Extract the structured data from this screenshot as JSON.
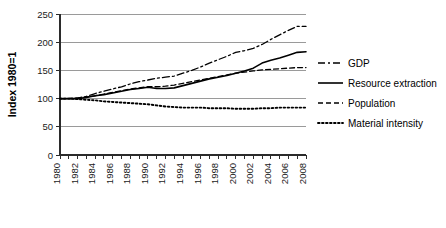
{
  "chart_data": {
    "type": "line",
    "title": "",
    "xlabel": "",
    "ylabel": "Index 1980=1",
    "xlim": [
      1980,
      2008
    ],
    "ylim": [
      0,
      250
    ],
    "yticks": [
      0,
      50,
      100,
      150,
      200,
      250
    ],
    "ytick_labels": [
      "0",
      "50",
      "100",
      "150",
      "200",
      "250"
    ],
    "grid": true,
    "grid_axis": "y",
    "legend_position": "right",
    "x": [
      1980,
      1981,
      1982,
      1983,
      1984,
      1985,
      1986,
      1987,
      1988,
      1989,
      1990,
      1991,
      1992,
      1993,
      1994,
      1995,
      1996,
      1997,
      1998,
      1999,
      2000,
      2001,
      2002,
      2003,
      2004,
      2005,
      2006,
      2007,
      2008
    ],
    "xtick_labels": [
      "1980",
      "1982",
      "1984",
      "1986",
      "1988",
      "1990",
      "1992",
      "1994",
      "1996",
      "1998",
      "2000",
      "2002",
      "2004",
      "2006",
      "2008"
    ],
    "xtick_label_step": 2,
    "xtick_minor_step": 1,
    "xtick_label_rotation": -90,
    "series": [
      {
        "name": "GDP",
        "style": "dashdot",
        "dasharray": "7,3,2,3",
        "width": 1.3,
        "color": "#000000",
        "values": [
          100,
          100,
          101,
          104,
          109,
          113,
          117,
          121,
          126,
          130,
          133,
          136,
          138,
          140,
          145,
          150,
          156,
          163,
          169,
          175,
          182,
          185,
          189,
          196,
          205,
          213,
          221,
          228,
          228
        ]
      },
      {
        "name": "Resource extraction",
        "style": "solid",
        "dasharray": "none",
        "width": 1.6,
        "color": "#000000",
        "values": [
          100,
          100,
          100,
          102,
          105,
          107,
          110,
          113,
          116,
          118,
          120,
          118,
          118,
          119,
          123,
          127,
          131,
          135,
          138,
          141,
          145,
          149,
          154,
          163,
          168,
          172,
          177,
          182,
          183
        ]
      },
      {
        "name": "Population",
        "style": "dashed",
        "dasharray": "5,3",
        "width": 1.3,
        "color": "#000000",
        "values": [
          100,
          100,
          101,
          103,
          105,
          108,
          111,
          114,
          117,
          119,
          121,
          121,
          122,
          124,
          127,
          130,
          133,
          136,
          139,
          142,
          145,
          147,
          149,
          151,
          152,
          153,
          154,
          155,
          155
        ]
      },
      {
        "name": "Material intensity",
        "style": "dotted",
        "dasharray": "1.6,2.4",
        "width": 1.9,
        "color": "#000000",
        "values": [
          100,
          100,
          99,
          98,
          97,
          95,
          94,
          93,
          92,
          91,
          90,
          88,
          86,
          85,
          84,
          84,
          84,
          83,
          83,
          83,
          82,
          82,
          82,
          83,
          83,
          84,
          84,
          84,
          84
        ]
      }
    ]
  },
  "legend": {
    "items": [
      {
        "label": "GDP"
      },
      {
        "label": "Resource extraction"
      },
      {
        "label": "Population"
      },
      {
        "label": "Material intensity"
      }
    ]
  }
}
